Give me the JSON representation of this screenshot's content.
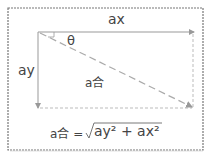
{
  "labels": {
    "ax": "ax",
    "ay": "ay",
    "theta": "θ",
    "resultant": "a合"
  },
  "formula": {
    "lhs": "a合 =",
    "radicand": "ay² + ax²"
  },
  "colors": {
    "border": "#777777",
    "arrow": "#999999",
    "dashed": "#aaaaaa",
    "text": "#444444"
  }
}
